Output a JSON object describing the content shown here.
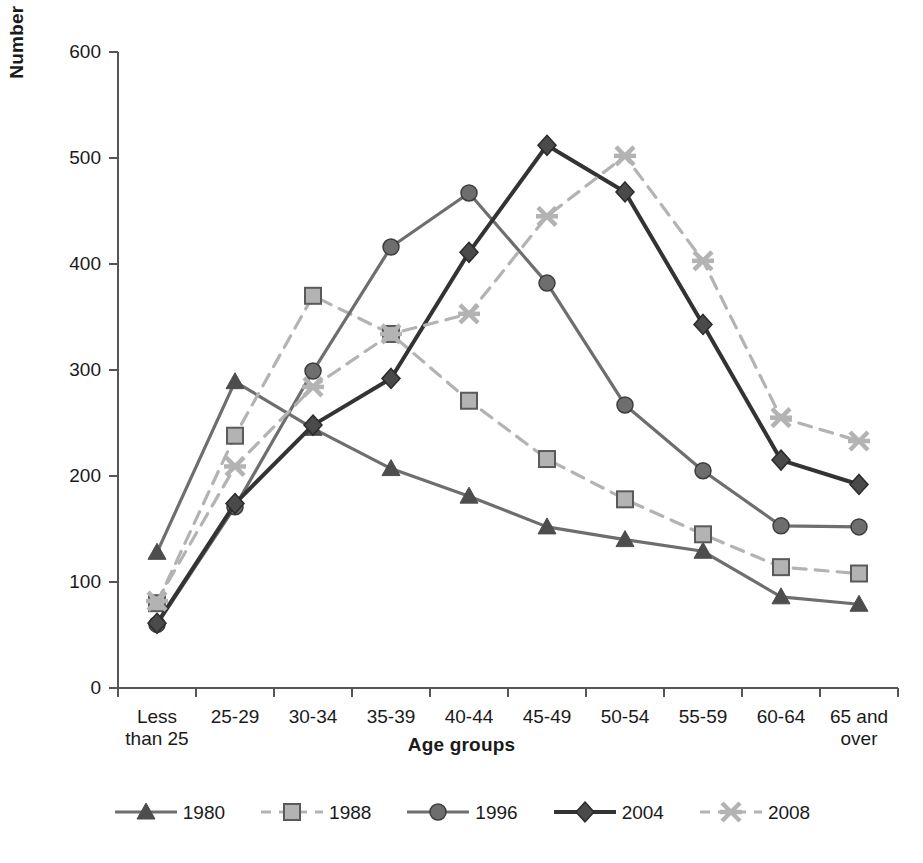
{
  "chart_data": {
    "type": "line",
    "title": "",
    "xlabel": "Age groups",
    "ylabel": "Number of RNs (thousands)",
    "categories": [
      "Less than 25",
      "25-29",
      "30-34",
      "35-39",
      "40-44",
      "45-49",
      "50-54",
      "55-59",
      "60-64",
      "65 and over"
    ],
    "ylim": [
      0,
      600
    ],
    "yticks": [
      0,
      100,
      200,
      300,
      400,
      500,
      600
    ],
    "grid": false,
    "legend_position": "bottom",
    "series": [
      {
        "name": "1980",
        "marker": "triangle",
        "dash": "solid",
        "color": "#6e6e6e",
        "values": [
          128,
          289,
          245,
          207,
          181,
          152,
          140,
          129,
          86,
          79
        ]
      },
      {
        "name": "1988",
        "marker": "square",
        "dash": "dashed",
        "color": "#b3b3b3",
        "values": [
          80,
          238,
          370,
          334,
          271,
          216,
          178,
          145,
          114,
          108
        ]
      },
      {
        "name": "1996",
        "marker": "circle",
        "dash": "solid",
        "color": "#6e6e6e",
        "values": [
          60,
          171,
          299,
          416,
          467,
          382,
          267,
          205,
          153,
          152
        ]
      },
      {
        "name": "2004",
        "marker": "diamond",
        "dash": "solid",
        "color": "#333333",
        "values": [
          61,
          174,
          248,
          292,
          411,
          512,
          468,
          343,
          215,
          192
        ]
      },
      {
        "name": "2008",
        "marker": "x",
        "dash": "dashed",
        "color": "#b3b3b3",
        "values": [
          82,
          209,
          284,
          334,
          353,
          445,
          502,
          403,
          255,
          233
        ]
      }
    ]
  },
  "ytick_labels": [
    "600",
    "500",
    "400",
    "300",
    "200",
    "100",
    "0"
  ],
  "xtick_labels": [
    {
      "line1": "Less",
      "line2": "than 25"
    },
    {
      "line1": "25-29",
      "line2": ""
    },
    {
      "line1": "30-34",
      "line2": ""
    },
    {
      "line1": "35-39",
      "line2": ""
    },
    {
      "line1": "40-44",
      "line2": ""
    },
    {
      "line1": "45-49",
      "line2": ""
    },
    {
      "line1": "50-54",
      "line2": ""
    },
    {
      "line1": "55-59",
      "line2": ""
    },
    {
      "line1": "60-64",
      "line2": ""
    },
    {
      "line1": "65 and",
      "line2": "over"
    }
  ],
  "legend": {
    "items": [
      {
        "label": "1980",
        "marker": "triangle",
        "color": "#6e6e6e",
        "dash": "solid"
      },
      {
        "label": "1988",
        "marker": "square",
        "color": "#b3b3b3",
        "dash": "dashed"
      },
      {
        "label": "1996",
        "marker": "circle",
        "color": "#6e6e6e",
        "dash": "solid"
      },
      {
        "label": "2004",
        "marker": "diamond",
        "color": "#333333",
        "dash": "solid"
      },
      {
        "label": "2008",
        "marker": "x",
        "color": "#b3b3b3",
        "dash": "dashed"
      }
    ]
  }
}
